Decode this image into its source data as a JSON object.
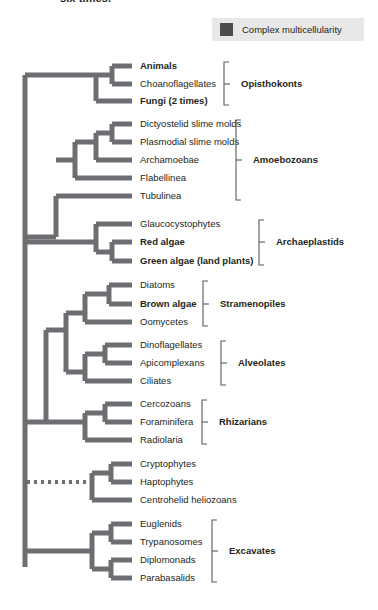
{
  "caption": {
    "text": "six times."
  },
  "legend": {
    "swatch_color": "#4d4d4d",
    "label": "Complex multicellularity",
    "background": "#e8e8e8"
  },
  "colors": {
    "branch": "#6d6e71",
    "text": "#231f20",
    "bracket": "#58595b"
  },
  "tree": {
    "type": "phylogenetic-cladogram",
    "root_x": 25,
    "tip_x": 132,
    "taxa": [
      {
        "id": "animals",
        "label": "Animals",
        "bold": true,
        "y": 66
      },
      {
        "id": "choanoflagellates",
        "label": "Choanoflagellates",
        "bold": false,
        "y": 84
      },
      {
        "id": "fungi",
        "label": "Fungi (2 times)",
        "bold": true,
        "y": 101
      },
      {
        "id": "dictyostelid",
        "label": "Dictyostelid slime molds",
        "bold": false,
        "y": 124
      },
      {
        "id": "plasmodial",
        "label": "Plasmodial slime molds",
        "bold": false,
        "y": 142
      },
      {
        "id": "archamoebae",
        "label": "Archamoebae",
        "bold": false,
        "y": 160
      },
      {
        "id": "flabellinea",
        "label": "Flabellinea",
        "bold": false,
        "y": 178
      },
      {
        "id": "tubulinea",
        "label": "Tubulinea",
        "bold": false,
        "y": 196
      },
      {
        "id": "glaucocystophytes",
        "label": "Glaucocystophytes",
        "bold": false,
        "y": 224
      },
      {
        "id": "red-algae",
        "label": "Red algae",
        "bold": true,
        "y": 242
      },
      {
        "id": "green-algae",
        "label": "Green algae (land plants)",
        "bold": true,
        "y": 261
      },
      {
        "id": "diatoms",
        "label": "Diatoms",
        "bold": false,
        "y": 285
      },
      {
        "id": "brown-algae",
        "label": "Brown algae",
        "bold": true,
        "y": 304
      },
      {
        "id": "oomycetes",
        "label": "Oomycetes",
        "bold": false,
        "y": 322
      },
      {
        "id": "dinoflagellates",
        "label": "Dinoflagellates",
        "bold": false,
        "y": 345
      },
      {
        "id": "apicomplexans",
        "label": "Apicomplexans",
        "bold": false,
        "y": 363
      },
      {
        "id": "ciliates",
        "label": "Ciliates",
        "bold": false,
        "y": 381
      },
      {
        "id": "cercozoans",
        "label": "Cercozoans",
        "bold": false,
        "y": 404
      },
      {
        "id": "foraminifera",
        "label": "Foraminifera",
        "bold": false,
        "y": 422
      },
      {
        "id": "radiolaria",
        "label": "Radiolaria",
        "bold": false,
        "y": 440
      },
      {
        "id": "cryptophytes",
        "label": "Cryptophytes",
        "bold": false,
        "y": 464
      },
      {
        "id": "haptophytes",
        "label": "Haptophytes",
        "bold": false,
        "y": 482
      },
      {
        "id": "centrohelid",
        "label": "Centrohelid heliozoans",
        "bold": false,
        "y": 500
      },
      {
        "id": "euglenids",
        "label": "Euglenids",
        "bold": false,
        "y": 524
      },
      {
        "id": "trypanosomes",
        "label": "Trypanosomes",
        "bold": false,
        "y": 542
      },
      {
        "id": "diplomonads",
        "label": "Diplomonads",
        "bold": false,
        "y": 560
      },
      {
        "id": "parabasalids",
        "label": "Parabasalids",
        "bold": false,
        "y": 578
      }
    ],
    "groups": [
      {
        "id": "opisthokonts",
        "label": "Opisthokonts",
        "top": 62,
        "bottom": 105,
        "label_y": 84
      },
      {
        "id": "amoebozoans",
        "label": "Amoebozoans",
        "top": 120,
        "bottom": 200,
        "label_y": 160
      },
      {
        "id": "archaeplastids",
        "label": "Archaeplastids",
        "top": 220,
        "bottom": 265,
        "label_y": 242
      },
      {
        "id": "stramenopiles",
        "label": "Stramenopiles",
        "top": 281,
        "bottom": 326,
        "label_y": 304
      },
      {
        "id": "alveolates",
        "label": "Alveolates",
        "top": 341,
        "bottom": 385,
        "label_y": 363
      },
      {
        "id": "rhizarians",
        "label": "Rhizarians",
        "top": 400,
        "bottom": 444,
        "label_y": 422
      },
      {
        "id": "excavates",
        "label": "Excavates",
        "top": 520,
        "bottom": 582,
        "label_y": 551
      }
    ],
    "group_brackets": {
      "opisthokonts": {
        "x": 224,
        "label_x": 241
      },
      "amoebozoans": {
        "x": 236,
        "label_x": 253
      },
      "archaeplastids": {
        "x": 259,
        "label_x": 276
      },
      "stramenopiles": {
        "x": 203,
        "label_x": 220
      },
      "alveolates": {
        "x": 221,
        "label_x": 238
      },
      "rhizarians": {
        "x": 202,
        "label_x": 219
      },
      "excavates": {
        "x": 212,
        "label_x": 229
      }
    },
    "edges": [
      {
        "id": "trunk",
        "kind": "solid",
        "points": "25,75 25,567"
      },
      {
        "id": "opisthokont-stem",
        "kind": "solid",
        "points": "25,75 96,75"
      },
      {
        "id": "opisthokont-node",
        "kind": "solid",
        "points": "96,75 96,101"
      },
      {
        "id": "opisthokont-ac-stem",
        "kind": "solid",
        "points": "96,75 112,75"
      },
      {
        "id": "opisthokont-ac-node",
        "kind": "solid",
        "points": "112,66 112,84"
      },
      {
        "id": "tip-animals",
        "kind": "solid",
        "points": "112,66 132,66"
      },
      {
        "id": "tip-choano",
        "kind": "solid",
        "points": "112,84 132,84"
      },
      {
        "id": "tip-fungi",
        "kind": "solid",
        "points": "96,101 132,101"
      },
      {
        "id": "amoebo-stem",
        "kind": "solid",
        "points": "25,237 56,237"
      },
      {
        "id": "amoebo-node",
        "kind": "solid",
        "points": "56,196 56,237"
      },
      {
        "id": "tip-tubulinea",
        "kind": "solid",
        "points": "56,196 132,196"
      },
      {
        "id": "amoebo-b-stem",
        "kind": "solid",
        "points": "56,160 75,160"
      },
      {
        "id": "amoebo-b-node",
        "kind": "solid",
        "points": "75,142 75,178"
      },
      {
        "id": "tip-flabellinea",
        "kind": "solid",
        "points": "75,178 132,178"
      },
      {
        "id": "amoebo-c-stem",
        "kind": "solid",
        "points": "75,142 96,142"
      },
      {
        "id": "amoebo-c-node",
        "kind": "solid",
        "points": "96,133 96,160"
      },
      {
        "id": "tip-archamoebae",
        "kind": "solid",
        "points": "96,160 132,160"
      },
      {
        "id": "amoebo-d-stem",
        "kind": "solid",
        "points": "96,133 112,133"
      },
      {
        "id": "amoebo-d-node",
        "kind": "solid",
        "points": "112,124 112,142"
      },
      {
        "id": "tip-dictyostelid",
        "kind": "solid",
        "points": "112,124 132,124"
      },
      {
        "id": "tip-plasmodial",
        "kind": "solid",
        "points": "112,142 132,142"
      },
      {
        "id": "archae-stem",
        "kind": "solid",
        "points": "25,242 96,242"
      },
      {
        "id": "archae-node",
        "kind": "solid",
        "points": "96,224 96,252"
      },
      {
        "id": "tip-glauco",
        "kind": "solid",
        "points": "96,224 132,224"
      },
      {
        "id": "archae-rg-stem",
        "kind": "solid",
        "points": "96,252 112,252"
      },
      {
        "id": "archae-rg-node",
        "kind": "solid",
        "points": "112,242 112,261"
      },
      {
        "id": "tip-redalgae",
        "kind": "solid",
        "points": "112,242 132,242"
      },
      {
        "id": "tip-greenalgae",
        "kind": "solid",
        "points": "112,261 132,261"
      },
      {
        "id": "sar-stem",
        "kind": "solid",
        "points": "25,422 46,422"
      },
      {
        "id": "sar-node",
        "kind": "solid",
        "points": "46,330 46,422"
      },
      {
        "id": "sa-node",
        "kind": "solid",
        "points": "66,313 66,372"
      },
      {
        "id": "sa-stem",
        "kind": "solid",
        "points": "46,330 66,330"
      },
      {
        "id": "stram-stem",
        "kind": "solid",
        "points": "66,313 85,313"
      },
      {
        "id": "stram-node",
        "kind": "solid",
        "points": "85,294 85,322"
      },
      {
        "id": "tip-oomycetes",
        "kind": "solid",
        "points": "85,322 132,322"
      },
      {
        "id": "stram-db-stem",
        "kind": "solid",
        "points": "85,294 109,294"
      },
      {
        "id": "stram-db-node",
        "kind": "solid",
        "points": "109,285 109,304"
      },
      {
        "id": "tip-diatoms",
        "kind": "solid",
        "points": "109,285 132,285"
      },
      {
        "id": "tip-brownalgae",
        "kind": "solid",
        "points": "109,304 132,304"
      },
      {
        "id": "alv-stem",
        "kind": "solid",
        "points": "66,372 85,372"
      },
      {
        "id": "alv-node",
        "kind": "solid",
        "points": "85,354 85,381"
      },
      {
        "id": "tip-ciliates",
        "kind": "solid",
        "points": "85,381 132,381"
      },
      {
        "id": "alv-da-stem",
        "kind": "solid",
        "points": "85,354 105,354"
      },
      {
        "id": "alv-da-node",
        "kind": "solid",
        "points": "105,345 105,363"
      },
      {
        "id": "tip-dino",
        "kind": "solid",
        "points": "105,345 132,345"
      },
      {
        "id": "tip-apicom",
        "kind": "solid",
        "points": "105,363 132,363"
      },
      {
        "id": "rhiz-stem",
        "kind": "solid",
        "points": "46,422 85,422"
      },
      {
        "id": "rhiz-node",
        "kind": "solid",
        "points": "85,413 85,440"
      },
      {
        "id": "tip-radiolaria",
        "kind": "solid",
        "points": "85,440 132,440"
      },
      {
        "id": "rhiz-cf-stem",
        "kind": "solid",
        "points": "85,413 105,413"
      },
      {
        "id": "rhiz-cf-node",
        "kind": "solid",
        "points": "105,404 105,422"
      },
      {
        "id": "tip-cercozoans",
        "kind": "solid",
        "points": "105,404 132,404"
      },
      {
        "id": "tip-foraminifera",
        "kind": "solid",
        "points": "105,422 132,422"
      },
      {
        "id": "crypt-dotted-stem",
        "kind": "dotted",
        "points": "27,482 92,482"
      },
      {
        "id": "crypt-node",
        "kind": "solid",
        "points": "92,473 92,500"
      },
      {
        "id": "tip-centrohelid",
        "kind": "solid",
        "points": "92,500 132,500"
      },
      {
        "id": "crypt-ch-stem",
        "kind": "solid",
        "points": "92,473 111,473"
      },
      {
        "id": "crypt-ch-node",
        "kind": "solid",
        "points": "111,464 111,482"
      },
      {
        "id": "tip-cryptophytes",
        "kind": "solid",
        "points": "111,464 132,464"
      },
      {
        "id": "tip-haptophytes",
        "kind": "solid",
        "points": "111,482 132,482"
      },
      {
        "id": "exc-stem",
        "kind": "solid",
        "points": "25,551 92,551"
      },
      {
        "id": "exc-node",
        "kind": "solid",
        "points": "92,533 92,569"
      },
      {
        "id": "exc-et-stem",
        "kind": "solid",
        "points": "92,533 111,533"
      },
      {
        "id": "exc-et-node",
        "kind": "solid",
        "points": "111,524 111,542"
      },
      {
        "id": "tip-euglenids",
        "kind": "solid",
        "points": "111,524 132,524"
      },
      {
        "id": "tip-trypanosomes",
        "kind": "solid",
        "points": "111,542 132,542"
      },
      {
        "id": "exc-dp-stem",
        "kind": "solid",
        "points": "92,569 111,569"
      },
      {
        "id": "exc-dp-node",
        "kind": "solid",
        "points": "111,560 111,578"
      },
      {
        "id": "tip-diplomonads",
        "kind": "solid",
        "points": "111,560 132,560"
      },
      {
        "id": "tip-parabasalids",
        "kind": "solid",
        "points": "111,578 132,578"
      }
    ]
  }
}
